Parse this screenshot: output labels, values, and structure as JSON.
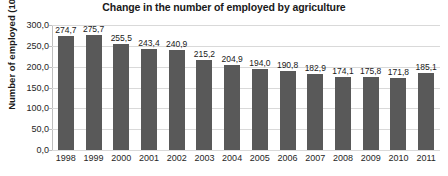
{
  "chart_data": {
    "type": "bar",
    "title": "Change in the number of employed by agriculture",
    "xlabel": "",
    "ylabel": "Number of employed (1000)",
    "categories": [
      "1998",
      "1999",
      "2000",
      "2001",
      "2002",
      "2003",
      "2004",
      "2005",
      "2006",
      "2007",
      "2008",
      "2009",
      "2010",
      "2011"
    ],
    "values": [
      274.7,
      275.7,
      255.5,
      243.4,
      240.9,
      215.2,
      204.9,
      194.0,
      190.8,
      182.9,
      174.1,
      175.8,
      171.8,
      185.1
    ],
    "value_labels": [
      "274,7",
      "275,7",
      "255,5",
      "243,4",
      "240,9",
      "215,2",
      "204,9",
      "194,0",
      "190,8",
      "182,9",
      "174,1",
      "175,8",
      "171,8",
      "185,1"
    ],
    "ylim": [
      0,
      300
    ],
    "yticks": [
      0,
      50,
      100,
      150,
      200,
      250,
      300
    ],
    "ytick_labels": [
      "0,0",
      "50,0",
      "100,0",
      "150,0",
      "200,0",
      "250,0",
      "300,0"
    ],
    "grid": true,
    "legend": false,
    "bar_color": "#595959",
    "grid_color": "#d9d9d9",
    "axis_color": "#bfbfbf",
    "text_color": "#1a1a1a",
    "decimal_separator": ","
  }
}
